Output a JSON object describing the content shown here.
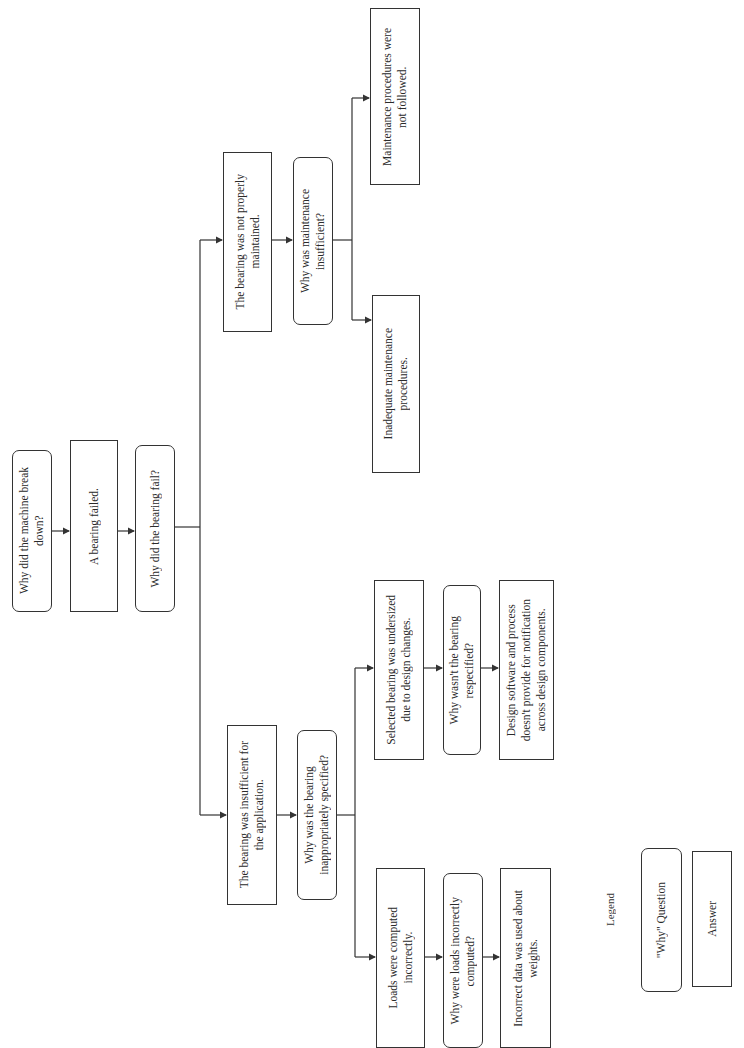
{
  "diagram": {
    "type": "five-whys",
    "orientation": "rotated 90° counter-clockwise",
    "nodes": {
      "q1": {
        "kind": "question",
        "text": "Why did the machine break\ndown?"
      },
      "a1": {
        "kind": "answer",
        "text": "A bearing failed."
      },
      "q2": {
        "kind": "question",
        "text": "Why did the bearing fail?"
      },
      "a2a": {
        "kind": "answer",
        "text": "The bearing was not properly\nmaintained."
      },
      "q3a": {
        "kind": "question",
        "text": "Why was maintenance\ninsufficient?"
      },
      "a3a1": {
        "kind": "answer",
        "text": "Maintenance procedures were\nnot followed."
      },
      "a3a2": {
        "kind": "answer",
        "text": "Inadequate maintenance\nprocedures."
      },
      "a2b": {
        "kind": "answer",
        "text": "The bearing was insufficient for\nthe application."
      },
      "q3b": {
        "kind": "question",
        "text": "Why was the bearing\ninappropriately specified?"
      },
      "a3b1": {
        "kind": "answer",
        "text": "Selected bearing was undersized\ndue to design changes."
      },
      "q4b1": {
        "kind": "question",
        "text": "Why wasn't the bearing\nrespecified?"
      },
      "a4b1": {
        "kind": "answer",
        "text": "Design software and process\ndoesn't provide for notification\nacross design components."
      },
      "a3b2": {
        "kind": "answer",
        "text": "Loads were computed\nincorrectly."
      },
      "q4b2": {
        "kind": "question",
        "text": "Why were loads incorrectly\ncomputed?"
      },
      "a4b2": {
        "kind": "answer",
        "text": "Incorrect data was used about\nweights."
      }
    },
    "edges": [
      [
        "q1",
        "a1"
      ],
      [
        "a1",
        "q2"
      ],
      [
        "q2",
        "a2a"
      ],
      [
        "q2",
        "a2b"
      ],
      [
        "a2a",
        "q3a"
      ],
      [
        "q3a",
        "a3a1"
      ],
      [
        "q3a",
        "a3a2"
      ],
      [
        "a2b",
        "q3b"
      ],
      [
        "q3b",
        "a3b1"
      ],
      [
        "q3b",
        "a3b2"
      ],
      [
        "a3b1",
        "q4b1"
      ],
      [
        "q4b1",
        "a4b1"
      ],
      [
        "a3b2",
        "q4b2"
      ],
      [
        "q4b2",
        "a4b2"
      ]
    ]
  },
  "legend": {
    "title": "Legend",
    "question_label": "\"Why\" Question",
    "answer_label": "Answer"
  },
  "colors": {
    "line": "#333333",
    "background": "#ffffff",
    "text": "#2a2a2a"
  }
}
